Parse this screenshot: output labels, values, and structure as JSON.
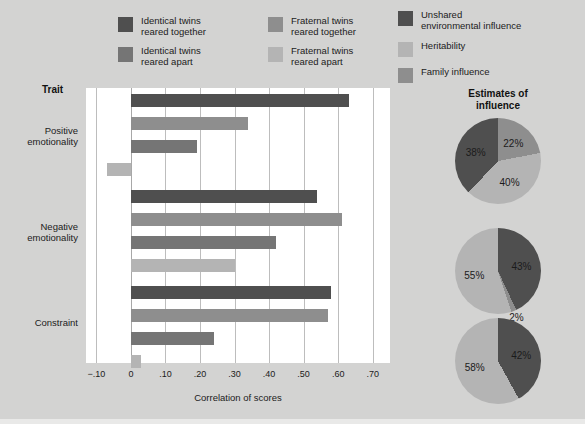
{
  "colors": {
    "background": "#d3d3d2",
    "plot_background": "#ffffff",
    "identical_together": "#4f4f4f",
    "identical_apart": "#757575",
    "fraternal_together": "#8e8e8e",
    "fraternal_apart": "#b4b4b4",
    "unshared_environmental": "#4f4f4f",
    "heritability": "#b4b4b4",
    "family_influence": "#8e8e8e",
    "gridline": "#bdbdbd"
  },
  "bar_legend": {
    "items": [
      {
        "label": "Identical twins\nreared together",
        "color_key": "identical_together",
        "swatch_name": "swatch-identical-together"
      },
      {
        "label": "Fraternal twins\nreared together",
        "color_key": "fraternal_together",
        "swatch_name": "swatch-fraternal-together"
      },
      {
        "label": "Identical twins\nreared apart",
        "color_key": "identical_apart",
        "swatch_name": "swatch-identical-apart"
      },
      {
        "label": "Fraternal twins\nreared apart",
        "color_key": "fraternal_apart",
        "swatch_name": "swatch-fraternal-apart"
      }
    ]
  },
  "pie_legend": {
    "items": [
      {
        "label": "Unshared\nenvironmental influence",
        "color_key": "unshared_environmental",
        "swatch_name": "swatch-unshared-environmental"
      },
      {
        "label": "Heritability",
        "color_key": "heritability",
        "swatch_name": "swatch-heritability"
      },
      {
        "label": "Family influence",
        "color_key": "family_influence",
        "swatch_name": "swatch-family-influence"
      }
    ]
  },
  "pies_title": "Estimates of\ninfluence",
  "trait_header": "Trait",
  "chart_data": {
    "type": "bar",
    "orientation": "horizontal",
    "title": "",
    "xlabel": "Correlation of scores",
    "ylabel": "Trait",
    "xlim": [
      -0.13,
      0.75
    ],
    "xticks": [
      -0.1,
      0,
      0.1,
      0.2,
      0.3,
      0.4,
      0.5,
      0.6,
      0.7
    ],
    "xtick_labels": [
      "−.10",
      "0",
      ".10",
      ".20",
      ".30",
      ".40",
      ".50",
      ".60",
      ".70"
    ],
    "grid": true,
    "legend_position": "top",
    "categories": [
      "Positive\nemotionality",
      "Negative\nemotionality",
      "Constraint"
    ],
    "series": [
      {
        "name": "Identical twins reared together",
        "color_key": "identical_together",
        "values": [
          0.63,
          0.54,
          0.58
        ]
      },
      {
        "name": "Fraternal twins reared together",
        "color_key": "fraternal_together",
        "values": [
          0.34,
          0.61,
          0.57
        ]
      },
      {
        "name": "Identical twins reared apart",
        "color_key": "identical_apart",
        "values": [
          0.19,
          0.42,
          0.24
        ]
      },
      {
        "name": "Fraternal twins reared apart",
        "color_key": "fraternal_apart",
        "values": [
          -0.07,
          0.3,
          0.03
        ]
      }
    ]
  },
  "pies_data": [
    {
      "name": "positive-emotionality-pie",
      "slices": [
        {
          "label": "22%",
          "value": 22,
          "color_key": "family_influence"
        },
        {
          "label": "40%",
          "value": 40,
          "color_key": "heritability"
        },
        {
          "label": "38%",
          "value": 38,
          "color_key": "unshared_environmental"
        }
      ]
    },
    {
      "name": "negative-emotionality-pie",
      "slices": [
        {
          "label": "43%",
          "value": 43,
          "color_key": "unshared_environmental"
        },
        {
          "label": "2%",
          "value": 2,
          "color_key": "family_influence"
        },
        {
          "label": "55%",
          "value": 55,
          "color_key": "heritability"
        }
      ]
    },
    {
      "name": "constraint-pie",
      "slices": [
        {
          "label": "42%",
          "value": 42,
          "color_key": "unshared_environmental"
        },
        {
          "label": "58%",
          "value": 58,
          "color_key": "heritability"
        }
      ]
    }
  ]
}
